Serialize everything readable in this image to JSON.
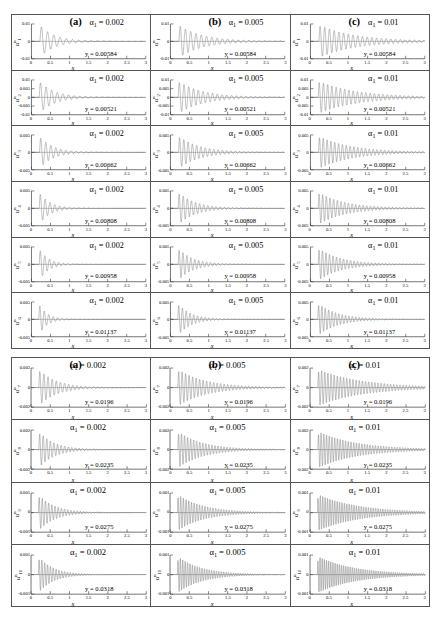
{
  "figure": {
    "x_axis": {
      "label": "x",
      "ticks": [
        "0",
        "0.5",
        "1",
        "1.5",
        "2",
        "2.5",
        "3"
      ],
      "min": 0,
      "max": 3
    },
    "columns": [
      {
        "letter": "(a)",
        "alpha_value": "0.002"
      },
      {
        "letter": "(b)",
        "alpha_value": "0.005"
      },
      {
        "letter": "(c)",
        "alpha_value": "0.01"
      }
    ],
    "alpha_prefix": "α",
    "alpha_subscript": "1",
    "alpha_equals": " = ",
    "y_prefix": "y = "
  },
  "groups": [
    {
      "name": "upper-group",
      "rows": [
        {
          "ylabel_base": "u",
          "ylabel_sup": "n",
          "ylabel_sub": "1",
          "yticks": [
            "0.01",
            "0",
            "-0.01"
          ],
          "y_value": "0.00584",
          "amp": 0.0098,
          "decay": 2.6,
          "cycles": 17,
          "start": 0.22
        },
        {
          "ylabel_base": "u",
          "ylabel_sup": "n",
          "ylabel_sub": "2",
          "yticks": [
            "0.01",
            "0.005",
            "0",
            "-0.005",
            "-0.01"
          ],
          "y_value": "0.00521",
          "amp": 0.009,
          "decay": 2.5,
          "cycles": 19,
          "start": 0.2
        },
        {
          "ylabel_base": "u",
          "ylabel_sup": "n",
          "ylabel_sub": "3",
          "yticks": [
            "0.005",
            "0",
            "-0.005"
          ],
          "y_value": "0.00662",
          "amp": 0.0044,
          "decay": 2.9,
          "cycles": 21,
          "start": 0.21
        },
        {
          "ylabel_base": "u",
          "ylabel_sup": "n",
          "ylabel_sub": "4",
          "yticks": [
            "0.005",
            "0",
            "-0.005"
          ],
          "y_value": "0.00808",
          "amp": 0.0043,
          "decay": 3.6,
          "cycles": 22,
          "start": 0.2
        },
        {
          "ylabel_base": "u",
          "ylabel_sup": "n",
          "ylabel_sub": "5",
          "yticks": [
            "0.005",
            "0",
            "-0.005"
          ],
          "y_value": "0.00958",
          "amp": 0.0042,
          "decay": 4.2,
          "cycles": 23,
          "start": 0.2
        },
        {
          "ylabel_base": "u",
          "ylabel_sup": "n",
          "ylabel_sub": "6",
          "yticks": [
            "0.005",
            "0",
            "-0.005"
          ],
          "y_value": "0.01137",
          "amp": 0.0041,
          "decay": 4.8,
          "cycles": 24,
          "start": 0.19
        }
      ]
    },
    {
      "name": "lower-group",
      "rows": [
        {
          "ylabel_base": "u",
          "ylabel_sup": "n",
          "ylabel_sub": "7",
          "yticks": [
            "0.002",
            "0",
            "-0.002"
          ],
          "y_value": "0.0196",
          "amp": 0.0019,
          "decay": 2.2,
          "cycles": 26,
          "start": 0.2
        },
        {
          "ylabel_base": "u",
          "ylabel_sup": "n",
          "ylabel_sub": "8",
          "yticks": [
            "0.002",
            "0",
            "-0.002"
          ],
          "y_value": "0.0235",
          "amp": 0.0018,
          "decay": 2.5,
          "cycles": 30,
          "start": 0.2
        },
        {
          "ylabel_base": "u",
          "ylabel_sup": "n",
          "ylabel_sub": "9",
          "yticks": [
            "0.001",
            "0",
            "-0.001"
          ],
          "y_value": "0.0275",
          "amp": 0.00095,
          "decay": 2.4,
          "cycles": 34,
          "start": 0.19
        },
        {
          "ylabel_base": "u",
          "ylabel_sup": "n",
          "ylabel_sub": "10",
          "yticks": [
            "0.001",
            "0",
            "-0.001"
          ],
          "y_value": "0.0318",
          "amp": 0.00094,
          "decay": 2.6,
          "cycles": 38,
          "start": 0.19
        }
      ]
    }
  ]
}
